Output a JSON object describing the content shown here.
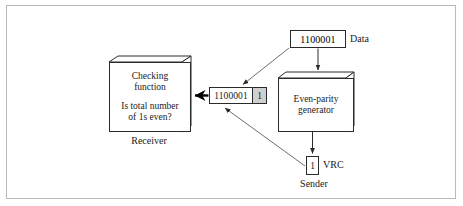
{
  "figure": {
    "frame_border_color": "#b9b9b9",
    "background": "#ffffff",
    "ink_color": "#1a1a1a",
    "parity_cell_fill": "#cfcfcf"
  },
  "nodes": {
    "data": {
      "value": "1100001",
      "caption": "Data"
    },
    "generator": {
      "label": "Even-parity\ngenerator"
    },
    "frame": {
      "data_bits": "1100001",
      "parity_bit": "1"
    },
    "vrc": {
      "value": "1",
      "caption": "VRC"
    },
    "sender": {
      "caption": "Sender"
    },
    "receiver": {
      "line1": "Checking\nfunction",
      "line2": "Is total number\nof 1s even?",
      "caption": "Receiver"
    }
  },
  "edges": [
    {
      "name": "data-to-generator",
      "from": "data",
      "to": "generator",
      "style": "vertical-arrow"
    },
    {
      "name": "data-to-frame",
      "from": "data",
      "to": "frame",
      "style": "diagonal-arrow"
    },
    {
      "name": "generator-to-vrc",
      "from": "generator",
      "to": "vrc",
      "style": "vertical-arrow"
    },
    {
      "name": "vrc-to-frame",
      "from": "vrc",
      "to": "frame",
      "style": "diagonal-arrow"
    },
    {
      "name": "frame-to-receiver",
      "from": "frame",
      "to": "receiver",
      "style": "thick-left-arrow"
    }
  ]
}
